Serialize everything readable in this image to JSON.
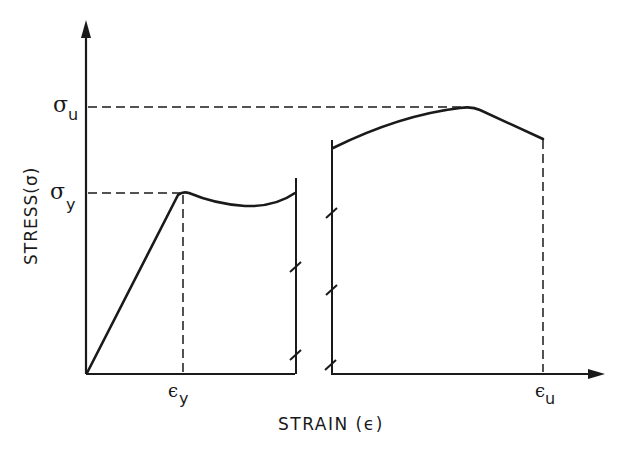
{
  "diagram": {
    "type": "stress-strain curve",
    "y_axis_label": "STRESS(σ)",
    "x_axis_label": "STRAIN (ε)",
    "y_ticks": [
      {
        "symbol": "σ",
        "subscript": "u",
        "meaning": "ultimate stress"
      },
      {
        "symbol": "σ",
        "subscript": "y",
        "meaning": "yield stress"
      }
    ],
    "x_ticks": [
      {
        "symbol": "ε",
        "subscript": "y",
        "meaning": "yield strain"
      },
      {
        "symbol": "ε",
        "subscript": "u",
        "meaning": "ultimate strain"
      }
    ],
    "regions": [
      {
        "name": "elastic",
        "description": "linear rise from origin to yield point"
      },
      {
        "name": "yield plateau",
        "description": "slight dip after yield point, axis broken"
      },
      {
        "name": "strain hardening / necking",
        "description": "rise to ultimate stress then decline to fracture at εu"
      }
    ],
    "axis_break_marks": {
      "left_panel": 2,
      "right_panel": 3
    },
    "colors": {
      "ink": "#1a1a1a",
      "background": "#ffffff"
    }
  }
}
